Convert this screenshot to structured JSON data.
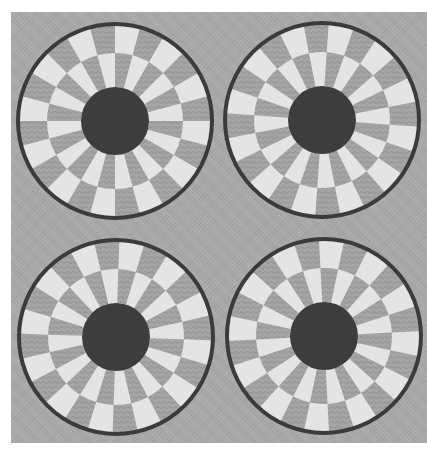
{
  "figure": {
    "colors": {
      "background_page": "#ffffff",
      "panel": "#a9a9a9",
      "light_tile": "#e4e4e4",
      "gray_tile": "#a5a5a5",
      "gray_tile_texture": "#9a9a9a",
      "outline": "#3b3b3b",
      "center_disc": "#3d3d3d"
    },
    "wheel_structure": {
      "sectors": 24,
      "rings": 2,
      "center_disc_radius": 34,
      "ring_boundary_radius": 68,
      "outer_radius": 97,
      "outline_width": 4
    },
    "wheels": [
      {
        "id": "top-left",
        "cx": 115,
        "cy": 121,
        "rotation": 0
      },
      {
        "id": "top-right",
        "cx": 322,
        "cy": 120,
        "rotation": 4
      },
      {
        "id": "bottom-left",
        "cx": 116,
        "cy": 337,
        "rotation": 2
      },
      {
        "id": "bottom-right",
        "cx": 324,
        "cy": 336,
        "rotation": -3
      }
    ]
  }
}
